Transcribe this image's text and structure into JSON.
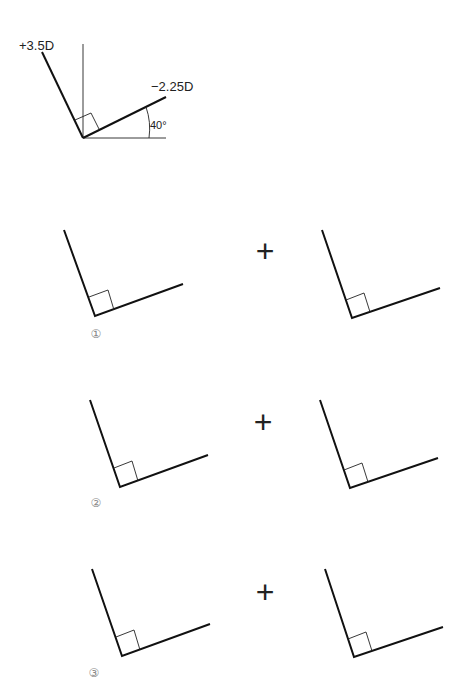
{
  "reference": {
    "axis_plus_label": "+3.5D",
    "axis_minus_label": "−2.25D",
    "angle_label": "40°"
  },
  "options": [
    {
      "number": "①",
      "operator": "+"
    },
    {
      "number": "②",
      "operator": "+"
    },
    {
      "number": "③",
      "operator": "+"
    }
  ]
}
